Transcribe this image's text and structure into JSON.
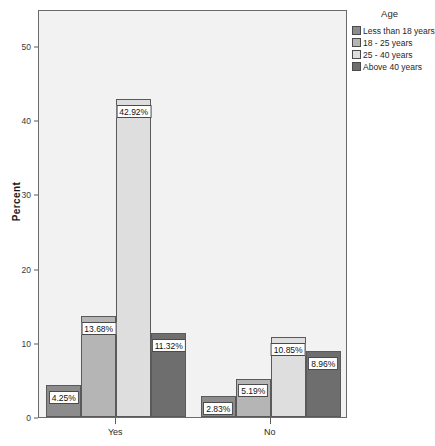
{
  "chart_data": {
    "type": "bar",
    "title": "",
    "xlabel": "",
    "ylabel": "Percent",
    "ylim": [
      0,
      55
    ],
    "yticks": [
      0,
      10,
      20,
      30,
      40,
      50
    ],
    "ytick_labels": [
      "0",
      "10",
      "20",
      "30",
      "40",
      "50"
    ],
    "grid": false,
    "legend_title": "Age",
    "legend_position": "right",
    "categories": [
      "Yes",
      "No"
    ],
    "series": [
      {
        "name": "Less than 18 years",
        "color": "#8c8c8c",
        "values": [
          4.25,
          2.83
        ],
        "labels": [
          "4.25%",
          "2.83%"
        ]
      },
      {
        "name": "18 - 25 years",
        "color": "#b5b5b5",
        "values": [
          13.68,
          5.19
        ],
        "labels": [
          "13.68%",
          "5.19%"
        ]
      },
      {
        "name": "25 - 40 years",
        "color": "#dedede",
        "values": [
          42.92,
          10.85
        ],
        "labels": [
          "42.92%",
          "10.85%"
        ]
      },
      {
        "name": "Above 40 years",
        "color": "#6e6e6e",
        "values": [
          11.32,
          8.96
        ],
        "labels": [
          "11.32%",
          "8.96%"
        ]
      }
    ]
  },
  "colors": {
    "plot_background": "#f2f2f2",
    "frame": "#6b6b6b",
    "axis_text": "#2a2a2a"
  }
}
